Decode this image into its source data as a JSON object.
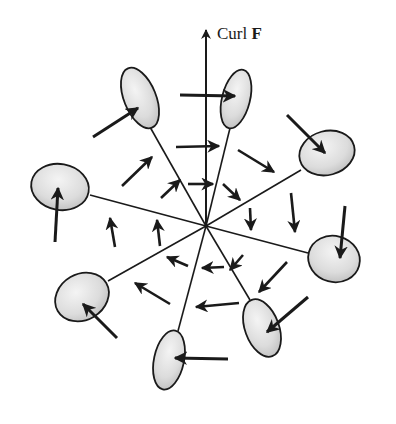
{
  "diagram": {
    "label": {
      "text": "Curl ",
      "bold": "F",
      "x": 217,
      "y": 38
    },
    "colors": {
      "ink": "#1a1a1a",
      "disc_fill_light": "#f2f2f2",
      "disc_fill_dark": "#bdbdbd"
    },
    "center": [
      206,
      226
    ],
    "axis": {
      "from": [
        206,
        226
      ],
      "to": [
        206,
        24
      ]
    },
    "discs": [
      {
        "name": "disc-upper-left",
        "cx": 140,
        "cy": 98,
        "rx": 16,
        "ry": 32,
        "rot": -22,
        "stem_from": [
          206,
          226
        ],
        "stem_to": [
          150,
          127
        ],
        "arrow": {
          "from": [
            93,
            137
          ],
          "to": [
            138,
            108
          ]
        }
      },
      {
        "name": "disc-upper-right",
        "cx": 236,
        "cy": 99,
        "rx": 14,
        "ry": 30,
        "rot": 14,
        "stem_from": [
          206,
          226
        ],
        "stem_to": [
          230,
          128
        ],
        "arrow": {
          "from": [
            180,
            95
          ],
          "to": [
            235,
            96
          ]
        }
      },
      {
        "name": "disc-right-top",
        "cx": 327,
        "cy": 153,
        "rx": 28,
        "ry": 22,
        "rot": -15,
        "stem_from": [
          206,
          226
        ],
        "stem_to": [
          301,
          170
        ],
        "arrow": {
          "from": [
            287,
            115
          ],
          "to": [
            325,
            153
          ]
        }
      },
      {
        "name": "disc-left",
        "cx": 60,
        "cy": 187,
        "rx": 29,
        "ry": 23,
        "rot": 10,
        "stem_from": [
          206,
          226
        ],
        "stem_to": [
          90,
          195
        ],
        "arrow": {
          "from": [
            55,
            242
          ],
          "to": [
            58,
            188
          ]
        }
      },
      {
        "name": "disc-right-bottom",
        "cx": 334,
        "cy": 259,
        "rx": 26,
        "ry": 23,
        "rot": 15,
        "stem_from": [
          206,
          226
        ],
        "stem_to": [
          308,
          253
        ],
        "arrow": {
          "from": [
            345,
            206
          ],
          "to": [
            340,
            258
          ]
        }
      },
      {
        "name": "disc-lower-left",
        "cx": 82,
        "cy": 297,
        "rx": 28,
        "ry": 23,
        "rot": -30,
        "stem_from": [
          206,
          226
        ],
        "stem_to": [
          108,
          281
        ],
        "arrow": {
          "from": [
            117,
            338
          ],
          "to": [
            83,
            304
          ]
        }
      },
      {
        "name": "disc-lower-right",
        "cx": 262,
        "cy": 328,
        "rx": 17,
        "ry": 30,
        "rot": -20,
        "stem_from": [
          206,
          226
        ],
        "stem_to": [
          250,
          300
        ],
        "arrow": {
          "from": [
            308,
            297
          ],
          "to": [
            267,
            332
          ]
        }
      },
      {
        "name": "disc-bottom",
        "cx": 169,
        "cy": 360,
        "rx": 15,
        "ry": 30,
        "rot": 12,
        "stem_from": [
          206,
          226
        ],
        "stem_to": [
          178,
          331
        ],
        "arrow": {
          "from": [
            228,
            359
          ],
          "to": [
            175,
            358
          ]
        }
      }
    ],
    "field_arrows": [
      {
        "from": [
          176,
          147
        ],
        "to": [
          219,
          146
        ]
      },
      {
        "from": [
          188,
          184
        ],
        "to": [
          213,
          184
        ]
      },
      {
        "from": [
          122,
          186
        ],
        "to": [
          152,
          157
        ]
      },
      {
        "from": [
          161,
          198
        ],
        "to": [
          180,
          180
        ]
      },
      {
        "from": [
          238,
          150
        ],
        "to": [
          274,
          172
        ]
      },
      {
        "from": [
          223,
          184
        ],
        "to": [
          240,
          200
        ]
      },
      {
        "from": [
          250,
          208
        ],
        "to": [
          251,
          230
        ]
      },
      {
        "from": [
          291,
          193
        ],
        "to": [
          295,
          232
        ]
      },
      {
        "from": [
          115,
          247
        ],
        "to": [
          110,
          218
        ]
      },
      {
        "from": [
          160,
          246
        ],
        "to": [
          157,
          220
        ]
      },
      {
        "from": [
          243,
          255
        ],
        "to": [
          230,
          270
        ]
      },
      {
        "from": [
          287,
          262
        ],
        "to": [
          259,
          292
        ]
      },
      {
        "from": [
          188,
          266
        ],
        "to": [
          167,
          257
        ]
      },
      {
        "from": [
          224,
          267
        ],
        "to": [
          202,
          268
        ]
      },
      {
        "from": [
          170,
          304
        ],
        "to": [
          135,
          283
        ]
      },
      {
        "from": [
          239,
          303
        ],
        "to": [
          196,
          307
        ]
      }
    ]
  }
}
